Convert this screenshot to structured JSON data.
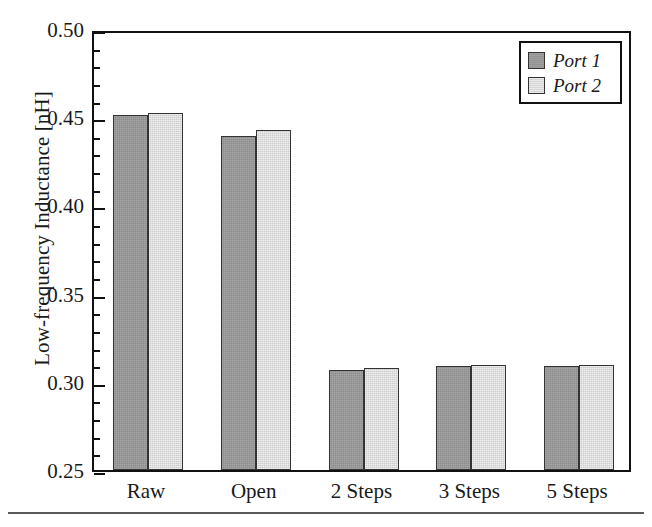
{
  "chart_data": {
    "type": "bar",
    "title": "",
    "xlabel": "",
    "ylabel": "Low-frequency Inductance [nH]",
    "categories": [
      "Raw",
      "Open",
      "2 Steps",
      "3 Steps",
      "5 Steps"
    ],
    "series": [
      {
        "name": "Port 1",
        "color": "#9a9a9a",
        "values": [
          0.451,
          0.4395,
          0.3068,
          0.3088,
          0.3088
        ]
      },
      {
        "name": "Port 2",
        "color": "#e2e2e2",
        "values": [
          0.4525,
          0.4425,
          0.3078,
          0.3093,
          0.3093
        ]
      }
    ],
    "ylim": [
      0.25,
      0.5
    ],
    "y_ticks": [
      0.25,
      0.3,
      0.35,
      0.4,
      0.45,
      0.5
    ],
    "y_tick_labels": [
      "0.25",
      "0.30",
      "0.35",
      "0.40",
      "0.45",
      "0.50"
    ],
    "y_minor_tick_step": 0.01,
    "grid": false,
    "legend_position": "upper right",
    "legend_entries": [
      "Port 1",
      "Port 2"
    ],
    "frame": true
  },
  "axes": {
    "y_title": "Low-frequency Inductance [nH]"
  },
  "legend": {
    "items": [
      {
        "label": "Port 1"
      },
      {
        "label": "Port 2"
      }
    ]
  }
}
